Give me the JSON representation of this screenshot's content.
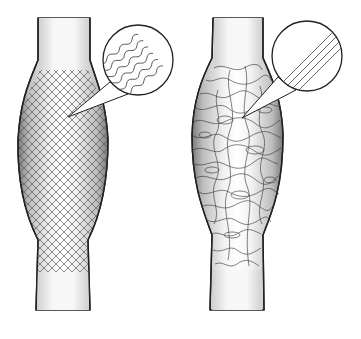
{
  "figure": {
    "panels": [
      {
        "id": "left",
        "name": "braided-mesh-graft",
        "texture": "crosshatch-mesh",
        "inset": {
          "texture": "wavy-fibers",
          "fiber_count": 6
        }
      },
      {
        "id": "right",
        "name": "random-fiber-graft",
        "texture": "random-tangled-fibers",
        "inset": {
          "texture": "straight-parallel-fibers",
          "fiber_count": 4
        }
      }
    ],
    "colors": {
      "background": "#ffffff",
      "outline": "#222222",
      "tube_light": "#f4f4f4",
      "tube_shade": "#9a9a9a",
      "mesh": "#555555"
    }
  }
}
